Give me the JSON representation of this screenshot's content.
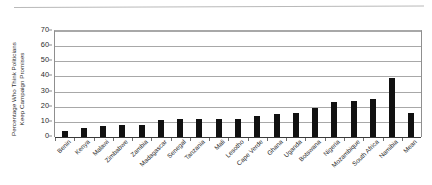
{
  "chart_data": {
    "type": "bar",
    "title": "",
    "xlabel": "",
    "ylabel": "Percentage Who Think Politicians Keep Campaign Promises",
    "ylabel_line1": "Percentage Who Think Politicians",
    "ylabel_line2": "Keep Campaign Promises",
    "ylim": [
      0,
      70
    ],
    "yticks": [
      0,
      10,
      20,
      30,
      40,
      50,
      60,
      70
    ],
    "grid": true,
    "legend": "none",
    "bar_color": "#111111",
    "grid_color": "#a8a8a8",
    "categories": [
      "Benin",
      "Kenya",
      "Malawi",
      "Zimbabwe",
      "Zambia",
      "Madagascar",
      "Senegal",
      "Tanzania",
      "Mali",
      "Lesotho",
      "Cape Verde",
      "Ghana",
      "Uganda",
      "Botswana",
      "Nigeria",
      "Mozambique",
      "South Africa",
      "Namibia",
      "Mean"
    ],
    "values": [
      4,
      6,
      7,
      8,
      8,
      11,
      12,
      12,
      12,
      12,
      14,
      15,
      16,
      19,
      23,
      24,
      25,
      39,
      16
    ]
  }
}
